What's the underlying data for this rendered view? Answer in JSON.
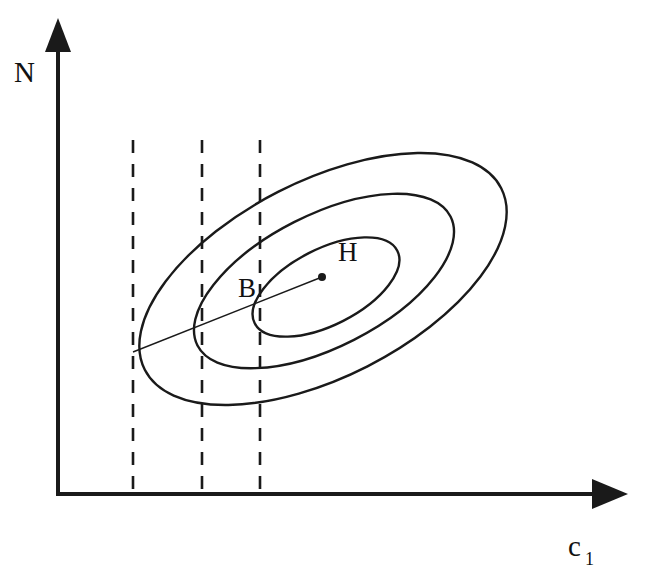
{
  "figure": {
    "title": "",
    "background_color": "#ffffff",
    "stroke_color": "#1a1a1a",
    "axes": {
      "y_label": "N",
      "x_label": "c",
      "x_label_subscript": "1",
      "origin": [
        58,
        494
      ],
      "y_axis_top": [
        58,
        23
      ],
      "x_axis_right": [
        625,
        494
      ]
    },
    "labels": {
      "point_b": "B",
      "point_h": "H"
    }
  },
  "chart_data": {
    "type": "line",
    "title": "",
    "xlabel": "c1",
    "ylabel": "N",
    "grid": false,
    "legend": null,
    "axis_style": {
      "x_axis": "arrow-right",
      "y_axis": "arrow-up",
      "ticks": false,
      "tick_labels": []
    },
    "ellipses": [
      {
        "name": "outer-contour",
        "cx": 323,
        "cy": 279,
        "rx": 200,
        "ry": 98,
        "rotation_deg": -27,
        "stroke": "#1a1a1a",
        "stroke_width": 2.4
      },
      {
        "name": "middle-contour",
        "cx": 324,
        "cy": 281,
        "rx": 142,
        "ry": 66,
        "rotation_deg": -27,
        "stroke": "#1a1a1a",
        "stroke_width": 2.4
      },
      {
        "name": "inner-contour",
        "cx": 326,
        "cy": 287,
        "rx": 80,
        "ry": 38,
        "rotation_deg": -27,
        "stroke": "#1a1a1a",
        "stroke_width": 2.4
      }
    ],
    "ray": {
      "name": "expansion-path",
      "from": [
        133,
        352
      ],
      "to": [
        322,
        277
      ],
      "stroke": "#1a1a1a",
      "stroke_width": 1.4
    },
    "points": [
      {
        "label": "H",
        "x": 322,
        "y": 277,
        "marker": "filled-dot",
        "radius": 4,
        "label_offset": [
          16,
          -16
        ]
      },
      {
        "label": "B",
        "x": 260,
        "y": 303,
        "marker": "none",
        "label_offset": [
          -22,
          -6
        ]
      }
    ],
    "vertical_dashed_lines": [
      {
        "name": "dashed-line-1",
        "x": 133,
        "y_top": 140,
        "y_bottom": 494
      },
      {
        "name": "dashed-line-2",
        "x": 202,
        "y_top": 140,
        "y_bottom": 494
      },
      {
        "name": "dashed-line-3",
        "x": 260,
        "y_top": 140,
        "y_bottom": 494
      }
    ]
  }
}
